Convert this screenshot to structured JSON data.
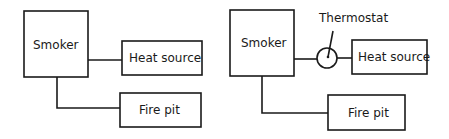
{
  "diagrams": [
    {
      "name": "without-thermostat",
      "nodes": {
        "smoker": {
          "label": "Smoker"
        },
        "heat_source": {
          "label": "Heat source"
        },
        "fire_pit": {
          "label": "Fire pit"
        }
      },
      "edges": [
        [
          "smoker",
          "heat_source"
        ],
        [
          "smoker",
          "fire_pit"
        ]
      ]
    },
    {
      "name": "with-thermostat",
      "nodes": {
        "smoker": {
          "label": "Smoker"
        },
        "thermostat": {
          "label": "Thermostat"
        },
        "heat_source": {
          "label": "Heat source"
        },
        "fire_pit": {
          "label": "Fire pit"
        }
      },
      "edges": [
        [
          "smoker",
          "thermostat"
        ],
        [
          "thermostat",
          "heat_source"
        ],
        [
          "smoker",
          "fire_pit"
        ]
      ]
    }
  ]
}
